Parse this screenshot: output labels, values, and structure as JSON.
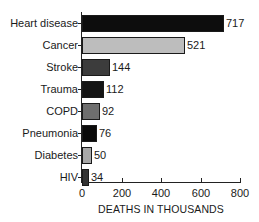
{
  "chart_data": {
    "type": "bar",
    "orientation": "horizontal",
    "title": "",
    "xlabel": "DEATHS IN THOUSANDS",
    "ylabel": "",
    "xlim": [
      0,
      800
    ],
    "xticks": [
      "0",
      "200",
      "400",
      "600",
      "800"
    ],
    "grid": false,
    "legend": null,
    "categories": [
      "Heart disease",
      "Cancer",
      "Stroke",
      "Trauma",
      "COPD",
      "Pneumonia",
      "Diabetes",
      "HIV"
    ],
    "values": [
      717,
      521,
      144,
      112,
      92,
      76,
      50,
      34
    ],
    "value_labels": [
      "717",
      "521",
      "144",
      "112",
      "92",
      "76",
      "50",
      "34"
    ],
    "bar_colors": [
      "#0d0d0d",
      "#bdbdbd",
      "#3c3c3c",
      "#141414",
      "#6e6e6e",
      "#0a0a0a",
      "#a8a8a8",
      "#333333"
    ]
  }
}
